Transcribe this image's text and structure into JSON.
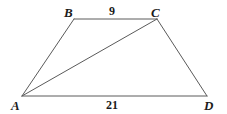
{
  "figure": {
    "name": "trapezoid-abcd-with-diagonal",
    "background_color": "#ffffff",
    "stroke_color": "#5a5a5a",
    "label_color": "#1b1b1b",
    "stroke_width": 1,
    "vertices": [
      {
        "id": "A",
        "label": "A",
        "x": 22,
        "y": 96,
        "label_x": 11,
        "label_y": 99
      },
      {
        "id": "B",
        "label": "B",
        "x": 74,
        "y": 19,
        "label_x": 64,
        "label_y": 6
      },
      {
        "id": "C",
        "label": "C",
        "x": 157,
        "y": 19,
        "label_x": 151,
        "label_y": 6
      },
      {
        "id": "D",
        "label": "D",
        "x": 207,
        "y": 96,
        "label_x": 204,
        "label_y": 99
      }
    ],
    "edges": [
      {
        "id": "AB",
        "from": "A",
        "to": "B",
        "x1": 22,
        "y1": 96,
        "x2": 74,
        "y2": 19
      },
      {
        "id": "BC",
        "from": "B",
        "to": "C",
        "x1": 74,
        "y1": 19,
        "x2": 157,
        "y2": 19
      },
      {
        "id": "CD",
        "from": "C",
        "to": "D",
        "x1": 157,
        "y1": 19,
        "x2": 207,
        "y2": 96
      },
      {
        "id": "AD",
        "from": "A",
        "to": "D",
        "x1": 22,
        "y1": 96,
        "x2": 207,
        "y2": 96
      },
      {
        "id": "AC",
        "from": "A",
        "to": "C",
        "x1": 22,
        "y1": 96,
        "x2": 157,
        "y2": 19
      }
    ],
    "side_labels": [
      {
        "id": "BC-length",
        "edge": "BC",
        "value": "9",
        "x": 109,
        "y": 5
      },
      {
        "id": "AD-length",
        "edge": "AD",
        "value": "21",
        "x": 106,
        "y": 99
      }
    ]
  }
}
